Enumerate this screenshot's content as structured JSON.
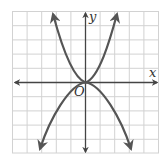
{
  "diagram": {
    "type": "coordinate-graph",
    "grid": {
      "cells_x": 10,
      "cells_y": 10,
      "color": "#cfcfcf"
    },
    "axes": {
      "x_label": "x",
      "y_label": "y",
      "origin_label": "O",
      "color": "#444444"
    },
    "curves": [
      {
        "name": "upward-parabola",
        "shape": "opens up, vertex at origin",
        "color": "#555555"
      },
      {
        "name": "downward-parabola",
        "shape": "opens down, vertex at origin",
        "color": "#555555"
      }
    ]
  }
}
